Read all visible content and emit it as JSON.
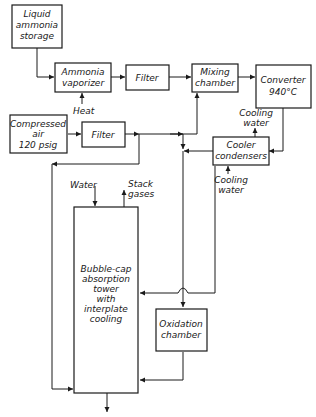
{
  "diagram": {
    "type": "process-flow",
    "title": "",
    "colors": {
      "ink": "#1a1a1a",
      "background": "#ffffff"
    },
    "nodes": [
      {
        "id": "storage",
        "lines": [
          "Liquid",
          "ammonia",
          "storage"
        ]
      },
      {
        "id": "vaporizer",
        "lines": [
          "Ammonia",
          "vaporizer"
        ]
      },
      {
        "id": "filter1",
        "lines": [
          "Filter"
        ]
      },
      {
        "id": "mixing",
        "lines": [
          "Mixing",
          "chamber"
        ]
      },
      {
        "id": "converter",
        "lines": [
          "Converter",
          "940°C"
        ]
      },
      {
        "id": "air",
        "lines": [
          "Compressed",
          "air",
          "120 psig"
        ]
      },
      {
        "id": "filter2",
        "lines": [
          "Filter"
        ]
      },
      {
        "id": "cooler",
        "lines": [
          "Cooler",
          "condensers"
        ]
      },
      {
        "id": "tower",
        "lines": [
          "Bubble-cap",
          "absorption",
          "tower",
          "with",
          "interplate",
          "cooling"
        ]
      },
      {
        "id": "oxidation",
        "lines": [
          "Oxidation",
          "chamber"
        ]
      }
    ],
    "labels": {
      "heat": "Heat",
      "cooling_water_top": [
        "Cooling",
        "water"
      ],
      "cooling_water_bottom": [
        "Cooling",
        "water"
      ],
      "water": "Water",
      "stack_gases": [
        "Stack",
        "gases"
      ]
    },
    "edges": [
      {
        "from": "storage",
        "to": "vaporizer"
      },
      {
        "from": "vaporizer",
        "to": "filter1"
      },
      {
        "from": "filter1",
        "to": "mixing"
      },
      {
        "from": "mixing",
        "to": "converter"
      },
      {
        "from": "converter",
        "to": "cooler"
      },
      {
        "from": "air",
        "to": "filter2"
      },
      {
        "from": "filter2",
        "to": "mixing"
      },
      {
        "from": "filter2",
        "to": "tower"
      },
      {
        "from": "cooler",
        "to": "oxidation"
      },
      {
        "from": "cooler",
        "to": "tower"
      },
      {
        "from": "oxidation",
        "to": "tower"
      }
    ]
  }
}
